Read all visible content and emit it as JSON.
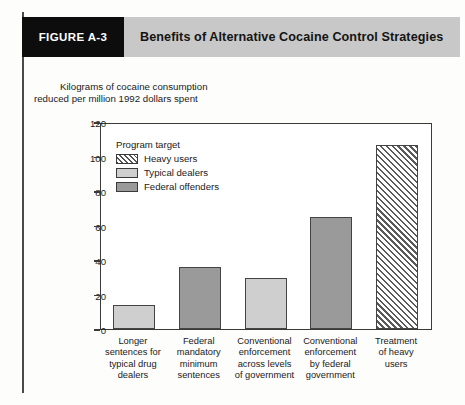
{
  "figure": {
    "tab_label": "FIGURE A-3",
    "title": "Benefits of Alternative Cocaine Control Strategies"
  },
  "axis_caption": {
    "line1": "Kilograms of cocaine consumption",
    "line2": "reduced per million 1992 dollars spent"
  },
  "legend": {
    "title": "Program target",
    "items": [
      {
        "label": "Heavy users",
        "pattern": "hatched",
        "color": "#ffffff"
      },
      {
        "label": "Typical dealers",
        "pattern": "solid",
        "color": "#cfcfcf"
      },
      {
        "label": "Federal offenders",
        "pattern": "solid",
        "color": "#9a9a9a"
      }
    ]
  },
  "yticks": [
    "0",
    "20",
    "40",
    "60",
    "80",
    "100",
    "120"
  ],
  "xlabels": [
    "Longer\nsentences for\ntypical drug\ndealers",
    "Federal\nmandatory\nminimum\nsentences",
    "Conventional\nenforcement\nacross levels\nof government",
    "Conventional\nenforcement\nby federal\ngovernment",
    "Treatment\nof heavy\nusers"
  ],
  "chart_data": {
    "type": "bar",
    "title": "Benefits of Alternative Cocaine Control Strategies",
    "xlabel": "",
    "ylabel": "Kilograms of cocaine consumption reduced per million 1992 dollars spent",
    "ylim": [
      0,
      120
    ],
    "yticks": [
      0,
      20,
      40,
      60,
      80,
      100,
      120
    ],
    "grid": false,
    "legend_position": "inside-upper-left",
    "legend_title": "Program target",
    "categories": [
      "Longer sentences for typical drug dealers",
      "Federal mandatory minimum sentences",
      "Conventional enforcement across levels of government",
      "Conventional enforcement by federal government",
      "Treatment of heavy users"
    ],
    "values": [
      14,
      36.5,
      30,
      65.5,
      108
    ],
    "bar_groups": [
      "Typical dealers",
      "Federal offenders",
      "Typical dealers",
      "Federal offenders",
      "Heavy users"
    ],
    "bar_styles": [
      "light",
      "dark",
      "light",
      "dark",
      "hatch"
    ]
  }
}
